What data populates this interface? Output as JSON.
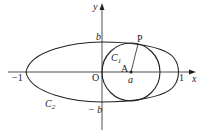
{
  "diagram": {
    "type": "geometry",
    "axes": {
      "x_label": "x",
      "y_label": "y",
      "origin_label": "O"
    },
    "tick_labels": {
      "neg_one": "−1",
      "one": "1",
      "b": "b",
      "neg_b": "− b",
      "a": "a"
    },
    "curves": {
      "ellipse": {
        "label": "C",
        "subscript": "2"
      },
      "circle": {
        "label": "C",
        "subscript": "1"
      }
    },
    "points": {
      "P": "P",
      "A": "A"
    },
    "colors": {
      "stroke": "#222222",
      "background": "#ffffff"
    }
  }
}
